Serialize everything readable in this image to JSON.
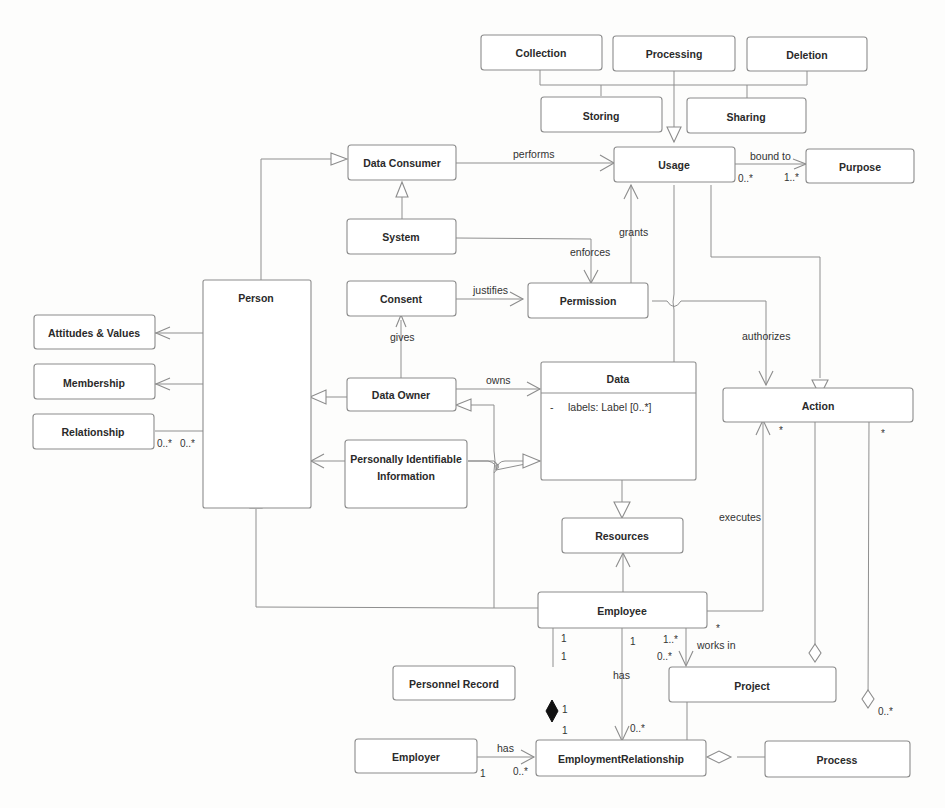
{
  "diagram": {
    "type": "UML class diagram",
    "classes": {
      "collection": "Collection",
      "processing": "Processing",
      "deletion": "Deletion",
      "storing": "Storing",
      "sharing": "Sharing",
      "usage": "Usage",
      "purpose": "Purpose",
      "data_consumer": "Data Consumer",
      "system": "System",
      "consent": "Consent",
      "permission": "Permission",
      "person": "Person",
      "attitudes_values": "Attitudes & Values",
      "membership": "Membership",
      "relationship": "Relationship",
      "data_owner": "Data Owner",
      "pii_line1": "Personally Identifiable",
      "pii_line2": "Information",
      "data": "Data",
      "data_attribute": "labels: Label [0..*]",
      "data_attribute_marker": "-",
      "resources": "Resources",
      "action": "Action",
      "employee": "Employee",
      "personnel_record": "Personnel Record",
      "project": "Project",
      "employer": "Employer",
      "employment_relationship": "EmploymentRelationship",
      "process": "Process"
    },
    "edge_labels": {
      "performs": "performs",
      "bound_to": "bound to",
      "grants": "grants",
      "enforces": "enforces",
      "justifies": "justifies",
      "gives": "gives",
      "owns": "owns",
      "authorizes": "authorizes",
      "executes": "executes",
      "works_in": "works in",
      "has_employee": "has",
      "has_employer": "has"
    },
    "multiplicities": {
      "usage_purpose_src": "0..*",
      "usage_purpose_dst": "1..*",
      "relationship_a": "0..*",
      "relationship_b": "0..*",
      "action_exec": "*",
      "action_process": "*",
      "employee_project_star": "*",
      "employee_project_src": "1..*",
      "employee_project_dst": "0..*",
      "employee_record_a": "1",
      "employee_record_b": "1",
      "employee_has": "1",
      "employment_has": "0..*",
      "record_comp_a": "1",
      "record_comp_b": "1",
      "employer_src": "1",
      "employer_dst": "0..*",
      "process_action": "0..*"
    },
    "relations": [
      {
        "from": "Collection",
        "to": "Usage",
        "kind": "generalization"
      },
      {
        "from": "Processing",
        "to": "Usage",
        "kind": "generalization"
      },
      {
        "from": "Deletion",
        "to": "Usage",
        "kind": "generalization"
      },
      {
        "from": "Storing",
        "to": "Usage",
        "kind": "generalization"
      },
      {
        "from": "Sharing",
        "to": "Usage",
        "kind": "generalization"
      },
      {
        "from": "Data Consumer",
        "to": "Usage",
        "kind": "association",
        "label": "performs"
      },
      {
        "from": "Usage",
        "to": "Purpose",
        "kind": "association",
        "label": "bound to",
        "src_mult": "0..*",
        "dst_mult": "1..*"
      },
      {
        "from": "System",
        "to": "Data Consumer",
        "kind": "generalization"
      },
      {
        "from": "Person",
        "to": "Data Consumer",
        "kind": "generalization"
      },
      {
        "from": "System",
        "to": "Permission",
        "kind": "association",
        "label": "enforces"
      },
      {
        "from": "Permission",
        "to": "Usage",
        "kind": "association",
        "label": "grants"
      },
      {
        "from": "Consent",
        "to": "Permission",
        "kind": "association",
        "label": "justifies"
      },
      {
        "from": "Data Owner",
        "to": "Consent",
        "kind": "association",
        "label": "gives"
      },
      {
        "from": "Data Owner",
        "to": "Data",
        "kind": "association",
        "label": "owns"
      },
      {
        "from": "Data Owner",
        "to": "Person",
        "kind": "generalization"
      },
      {
        "from": "Person",
        "to": "Attitudes & Values",
        "kind": "association"
      },
      {
        "from": "Person",
        "to": "Membership",
        "kind": "association"
      },
      {
        "from": "Person",
        "to": "Relationship",
        "kind": "association",
        "src_mult": "0..*",
        "dst_mult": "0..*"
      },
      {
        "from": "Personally Identifiable Information",
        "to": "Person",
        "kind": "association"
      },
      {
        "from": "Personally Identifiable Information",
        "to": "Data",
        "kind": "generalization"
      },
      {
        "from": "Permission",
        "to": "Action",
        "kind": "association",
        "label": "authorizes"
      },
      {
        "from": "Usage",
        "to": "Action",
        "kind": "generalization"
      },
      {
        "from": "Usage",
        "to": "Data",
        "kind": "association"
      },
      {
        "from": "Data",
        "to": "Resources",
        "kind": "generalization"
      },
      {
        "from": "Employee",
        "to": "Resources",
        "kind": "association"
      },
      {
        "from": "Employee",
        "to": "Person",
        "kind": "generalization"
      },
      {
        "from": "Employee",
        "to": "Data Owner",
        "kind": "generalization"
      },
      {
        "from": "Employee",
        "to": "Action",
        "kind": "association",
        "label": "executes",
        "dst_mult": "*"
      },
      {
        "from": "Employee",
        "to": "Project",
        "kind": "association",
        "label": "works in",
        "src_mult": "1..*",
        "dst_mult": "0..*"
      },
      {
        "from": "Employee",
        "to": "Personnel Record",
        "kind": "association",
        "src_mult": "1",
        "dst_mult": "1"
      },
      {
        "from": "Employee",
        "to": "EmploymentRelationship",
        "kind": "association",
        "label": "has",
        "src_mult": "1",
        "dst_mult": "0..*"
      },
      {
        "from": "Personnel Record",
        "to": "EmploymentRelationship",
        "kind": "composition",
        "src_mult": "1",
        "dst_mult": "1"
      },
      {
        "from": "Employer",
        "to": "EmploymentRelationship",
        "kind": "association",
        "label": "has",
        "src_mult": "1",
        "dst_mult": "0..*"
      },
      {
        "from": "Process",
        "to": "EmploymentRelationship",
        "kind": "aggregation"
      },
      {
        "from": "Project",
        "to": "EmploymentRelationship",
        "kind": "association"
      },
      {
        "from": "Project",
        "to": "Action",
        "kind": "aggregation"
      },
      {
        "from": "Process",
        "to": "Action",
        "kind": "aggregation",
        "src_mult": "0..*",
        "dst_mult": "*"
      }
    ]
  }
}
